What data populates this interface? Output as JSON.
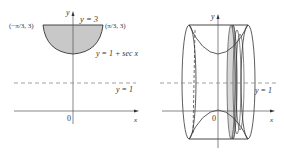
{
  "left_panel": {
    "axis_y_label": "y",
    "axis_x_label": "x",
    "origin_label": "0",
    "top_line_label": "y = 3",
    "left_point_label": "(−π/3, 3)",
    "right_point_label": "(π/3, 3)",
    "curve_label": "y = 1 + sec x",
    "dashed_line_label": "y = 1"
  },
  "right_panel": {
    "axis_y_label": "y",
    "axis_x_label": "x",
    "origin_label": "0",
    "dashed_line_label": "y = 1"
  },
  "colors": {
    "shade": "#c8c8c8",
    "line": "#333333",
    "dashed": "#888888"
  }
}
